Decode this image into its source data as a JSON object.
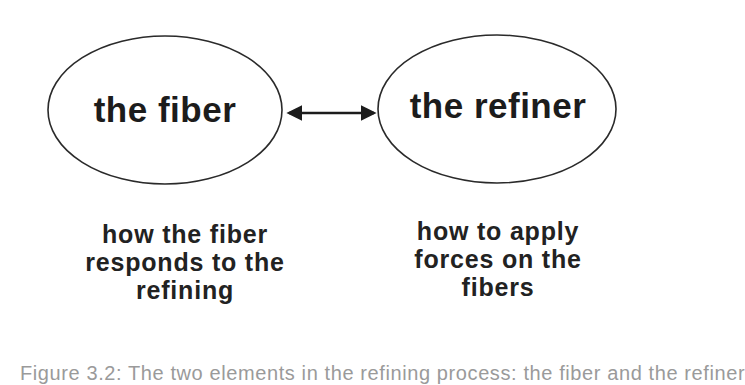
{
  "diagram": {
    "nodes": [
      {
        "id": "fiber",
        "label": "the fiber"
      },
      {
        "id": "refiner",
        "label": "the refiner"
      }
    ],
    "edge": {
      "from": "fiber",
      "to": "refiner",
      "type": "bidirectional-arrow"
    },
    "descriptions": {
      "fiber": [
        "how the fiber",
        "responds to the",
        "refining"
      ],
      "refiner": [
        "how to apply",
        "forces on the",
        "fibers"
      ]
    },
    "caption": "Figure 3.2: The two elements in the refining process: the fiber and the refiner",
    "colors": {
      "ink": "#1c1c1c",
      "background": "#ffffff",
      "caption": "#9a9a9a"
    }
  }
}
